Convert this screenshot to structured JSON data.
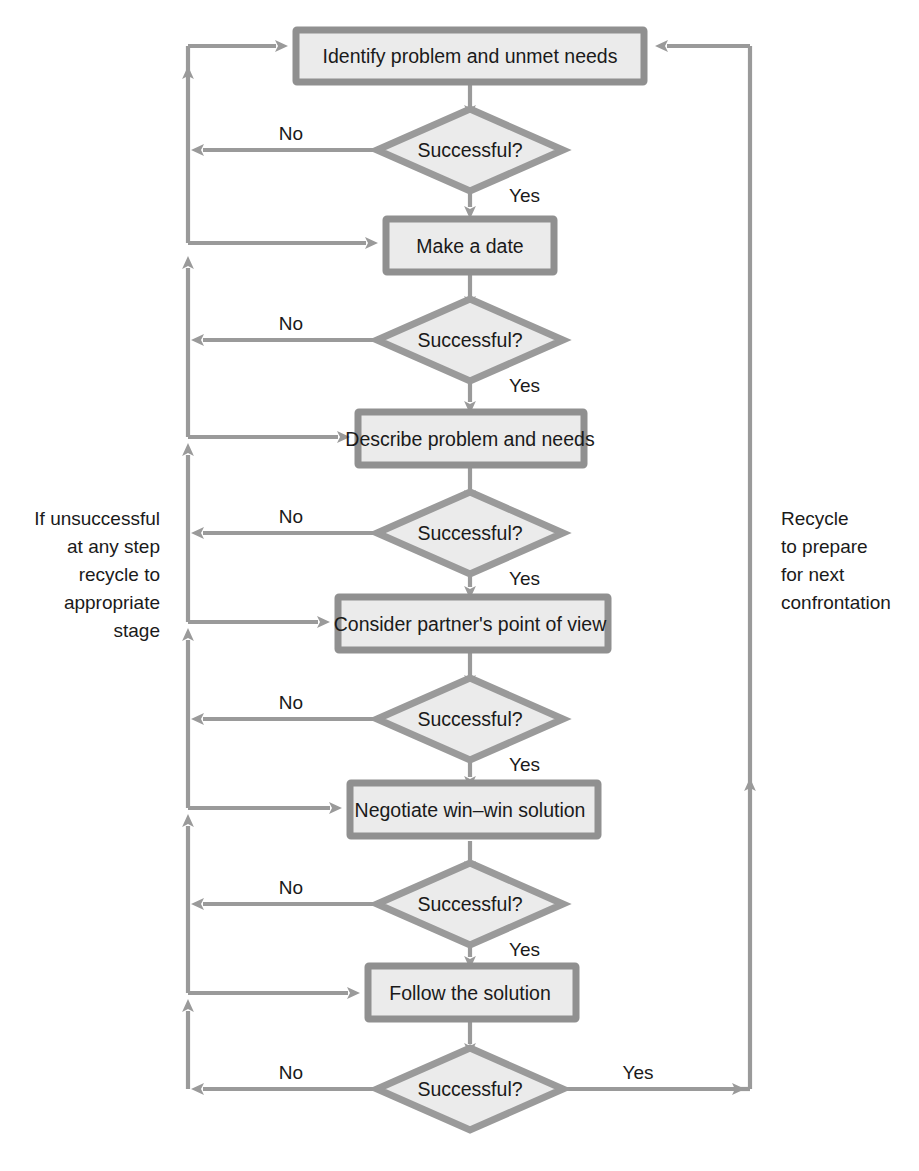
{
  "diagram": {
    "type": "flowchart",
    "colors": {
      "shape_fill": "#ebebeb",
      "shape_border": "#909090",
      "connector": "#969696",
      "text": "#1a1a1a",
      "background": "#ffffff"
    },
    "process_steps": [
      {
        "id": "step1",
        "label": "Identify problem and unmet needs"
      },
      {
        "id": "step2",
        "label": "Make a date"
      },
      {
        "id": "step3",
        "label": "Describe problem and needs"
      },
      {
        "id": "step4",
        "label": "Consider partner's point of view"
      },
      {
        "id": "step5",
        "label": "Negotiate win–win solution"
      },
      {
        "id": "step6",
        "label": "Follow the solution"
      }
    ],
    "decisions": [
      {
        "id": "dec1",
        "label": "Successful?"
      },
      {
        "id": "dec2",
        "label": "Successful?"
      },
      {
        "id": "dec3",
        "label": "Successful?"
      },
      {
        "id": "dec4",
        "label": "Successful?"
      },
      {
        "id": "dec5",
        "label": "Successful?"
      },
      {
        "id": "dec6",
        "label": "Successful?"
      }
    ],
    "edge_labels": {
      "yes": "Yes",
      "no": "No"
    },
    "branch_labels": [
      {
        "id": "no1",
        "text": "No"
      },
      {
        "id": "yes1",
        "text": "Yes"
      },
      {
        "id": "no2",
        "text": "No"
      },
      {
        "id": "yes2",
        "text": "Yes"
      },
      {
        "id": "no3",
        "text": "No"
      },
      {
        "id": "yes3",
        "text": "Yes"
      },
      {
        "id": "no4",
        "text": "No"
      },
      {
        "id": "yes4",
        "text": "Yes"
      },
      {
        "id": "no5",
        "text": "No"
      },
      {
        "id": "yes5",
        "text": "Yes"
      },
      {
        "id": "no6",
        "text": "No"
      },
      {
        "id": "yes6",
        "text": "Yes"
      }
    ],
    "left_note": {
      "align": "right",
      "lines": [
        "If unsuccessful",
        "at any step",
        "recycle to",
        "appropriate",
        "stage"
      ]
    },
    "right_note": {
      "align": "left",
      "lines": [
        "Recycle",
        "to  prepare",
        "for next",
        "confrontation"
      ]
    }
  }
}
